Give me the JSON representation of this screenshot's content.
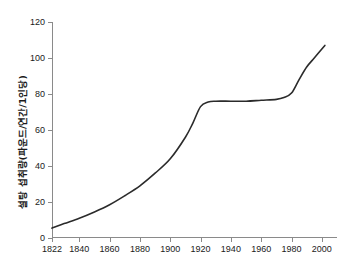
{
  "chart_data": {
    "type": "line",
    "title": "",
    "xlabel": "",
    "ylabel": "설탕 섭취량(파운드/연간/1인당)",
    "xlim": [
      1822,
      2010
    ],
    "ylim": [
      0,
      120
    ],
    "grid": false,
    "legend": null,
    "x_tick_labels": [
      "1822",
      "1840",
      "1860",
      "1880",
      "1900",
      "1920",
      "1940",
      "1960",
      "1980",
      "2000"
    ],
    "x_ticks": [
      1822,
      1840,
      1860,
      1880,
      1900,
      1920,
      1940,
      1960,
      1980,
      2000
    ],
    "y_tick_labels": [
      "0",
      "20",
      "40",
      "60",
      "80",
      "100",
      "120"
    ],
    "y_ticks": [
      0,
      20,
      40,
      60,
      80,
      100,
      120
    ],
    "series": [
      {
        "name": "설탕 섭취량",
        "color": "#2b2b2b",
        "x": [
          1822,
          1830,
          1840,
          1850,
          1860,
          1870,
          1880,
          1890,
          1900,
          1910,
          1915,
          1920,
          1925,
          1930,
          1940,
          1950,
          1960,
          1970,
          1975,
          1980,
          1985,
          1990,
          1995,
          2000,
          2002
        ],
        "values": [
          5.5,
          8,
          11,
          14.5,
          18.5,
          23.5,
          29,
          36,
          44,
          56,
          64,
          73,
          75.5,
          76,
          76,
          76,
          76.5,
          77,
          78,
          80.5,
          88,
          95,
          100,
          105,
          107
        ]
      }
    ]
  },
  "axis_colors": {
    "axis": "#8a8a8a",
    "tick_text": "#1a1a1a",
    "background": "#ffffff"
  }
}
